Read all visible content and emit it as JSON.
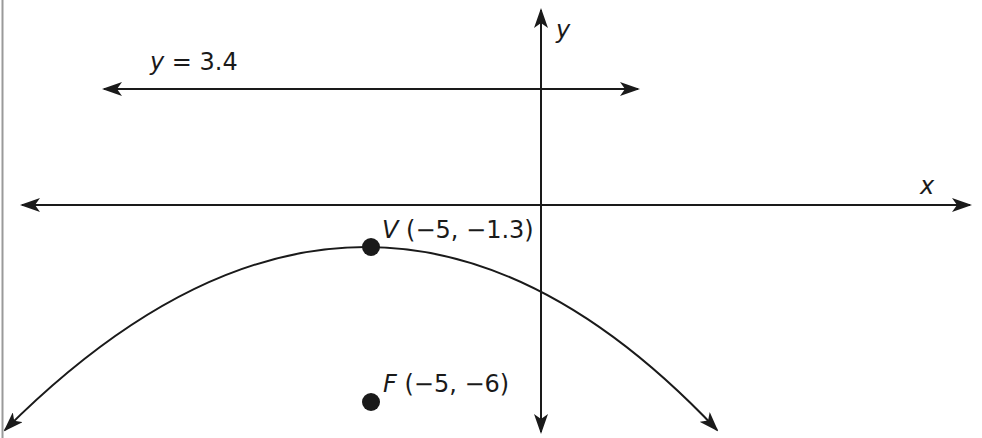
{
  "diagram": {
    "type": "coordinate-plane-parabola",
    "axes": {
      "x_label": "x",
      "y_label": "y"
    },
    "directrix": {
      "var": "y",
      "eq": " = 3.4",
      "value": 3.4
    },
    "vertex": {
      "name": "V",
      "coords": " (−5, −1.3)",
      "x": -5,
      "y": -1.3
    },
    "focus": {
      "name": "F",
      "coords": " (−5, −6)",
      "x": -5,
      "y": -6
    },
    "parabola": {
      "opens": "down"
    },
    "colors": {
      "ink": "#1a1a1a",
      "border": "#9a9a9a",
      "background": "#ffffff"
    }
  }
}
